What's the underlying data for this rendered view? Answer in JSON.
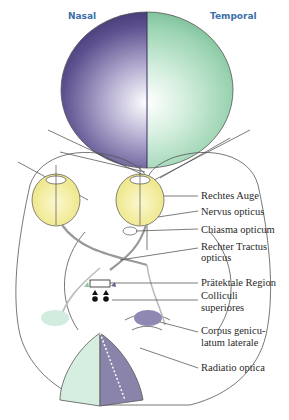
{
  "header": {
    "nasal": "Nasal",
    "temporal": "Temporal"
  },
  "colors": {
    "nasal_field": "#4b3f7a",
    "temporal_field": "#8fcfa8",
    "eye_yellow": "#f2eda0",
    "left_cortex": "#d6eee0",
    "right_cortex": "#8b84aa",
    "label_text": "#2a2a2a",
    "header_text": "#3b6fa8",
    "outline": "#555555"
  },
  "labels": [
    {
      "id": "rechtes-auge",
      "lines": [
        "Rechtes Auge"
      ]
    },
    {
      "id": "nervus-opticus",
      "lines": [
        "Nervus opticus"
      ]
    },
    {
      "id": "chiasma-opticum",
      "lines": [
        "Chiasma opticum"
      ]
    },
    {
      "id": "rechter-tractus-opticus",
      "lines": [
        "Rechter Tractus",
        "opticus"
      ]
    },
    {
      "id": "praetektale-region",
      "lines": [
        "Prätektale Region"
      ]
    },
    {
      "id": "colliculi-superiores",
      "lines": [
        "Colliculi",
        "superiores"
      ]
    },
    {
      "id": "corpus-geniculatum-laterale",
      "lines": [
        "Corpus genicu-",
        "latum laterale"
      ]
    },
    {
      "id": "radiatio-optica",
      "lines": [
        "Radiatio optica"
      ]
    }
  ]
}
